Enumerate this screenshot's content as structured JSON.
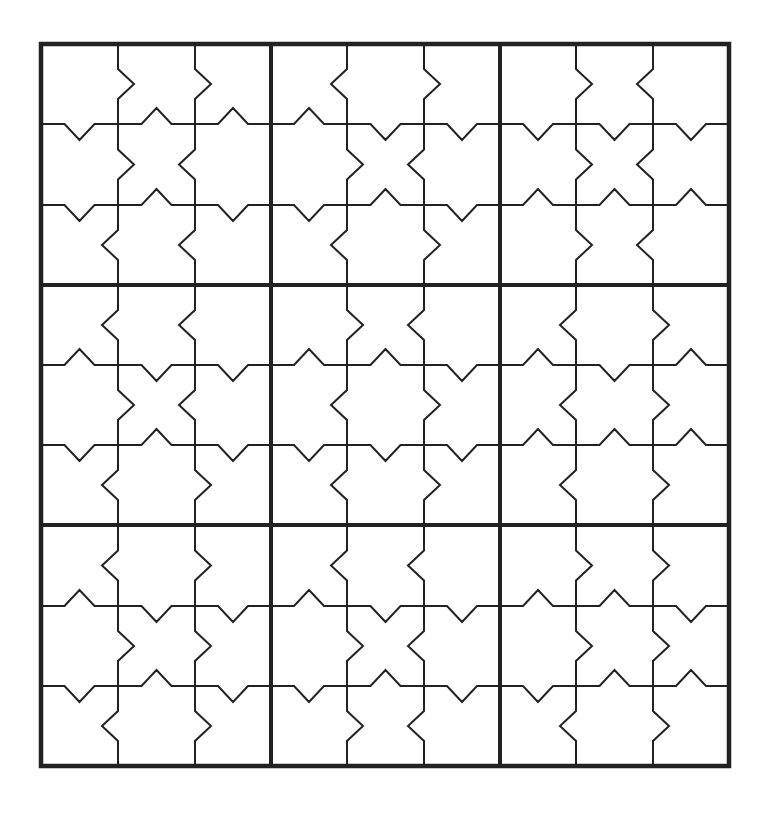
{
  "puzzle": {
    "type": "jigsaw-edge-sudoku",
    "rows": 9,
    "cols": 9,
    "box_size": 3,
    "line_color": "#222222",
    "background": "#ffffff",
    "x_lines": [
      41,
      118,
      195,
      271,
      347,
      424,
      500,
      576,
      653,
      729
    ],
    "y_lines": [
      44,
      124,
      205,
      285,
      365,
      445,
      525,
      606,
      686,
      766
    ],
    "notch_half_width": 15,
    "notch_depth": 16,
    "vertical_notches": {
      "note": "index [boundary 1..8 excluding 3,6][row 0..8]; +1 = points right, -1 = points left",
      "1": [
        1,
        1,
        -1,
        -1,
        1,
        -1,
        -1,
        1,
        -1
      ],
      "2": [
        1,
        -1,
        -1,
        -1,
        -1,
        1,
        1,
        1,
        1
      ],
      "4": [
        -1,
        1,
        -1,
        1,
        -1,
        -1,
        -1,
        1,
        1
      ],
      "5": [
        1,
        -1,
        1,
        -1,
        1,
        1,
        -1,
        -1,
        -1
      ],
      "7": [
        1,
        1,
        1,
        -1,
        -1,
        -1,
        1,
        1,
        -1
      ],
      "8": [
        -1,
        -1,
        -1,
        1,
        1,
        1,
        1,
        1,
        1
      ]
    },
    "horizontal_notches": {
      "note": "index [boundary 1..8 excluding 3,6][col 0..8]; +1 = points down, -1 = points up",
      "1": [
        1,
        -1,
        -1,
        -1,
        1,
        1,
        1,
        1,
        1
      ],
      "2": [
        1,
        -1,
        1,
        1,
        -1,
        1,
        -1,
        -1,
        -1
      ],
      "4": [
        -1,
        1,
        1,
        -1,
        -1,
        1,
        -1,
        1,
        -1
      ],
      "5": [
        1,
        -1,
        1,
        1,
        1,
        1,
        -1,
        -1,
        -1
      ],
      "7": [
        -1,
        1,
        1,
        -1,
        1,
        1,
        -1,
        -1,
        1
      ],
      "8": [
        1,
        -1,
        1,
        1,
        -1,
        1,
        1,
        -1,
        -1
      ]
    },
    "cells": [
      [
        "",
        "",
        "",
        "",
        "",
        "",
        "",
        "",
        ""
      ],
      [
        "",
        "",
        "",
        "",
        "",
        "",
        "",
        "",
        ""
      ],
      [
        "",
        "",
        "",
        "",
        "",
        "",
        "",
        "",
        ""
      ],
      [
        "",
        "",
        "",
        "",
        "",
        "",
        "",
        "",
        ""
      ],
      [
        "",
        "",
        "",
        "",
        "",
        "",
        "",
        "",
        ""
      ],
      [
        "",
        "",
        "",
        "",
        "",
        "",
        "",
        "",
        ""
      ],
      [
        "",
        "",
        "",
        "",
        "",
        "",
        "",
        "",
        ""
      ],
      [
        "",
        "",
        "",
        "",
        "",
        "",
        "",
        "",
        ""
      ],
      [
        "",
        "",
        "",
        "",
        "",
        "",
        "",
        "",
        ""
      ]
    ]
  }
}
